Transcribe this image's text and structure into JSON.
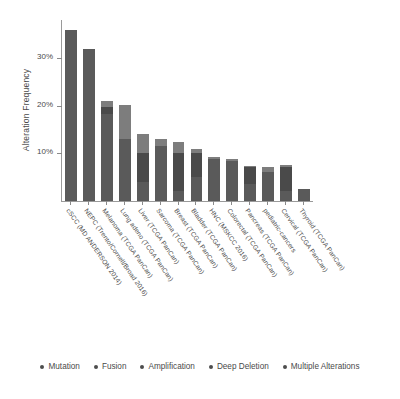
{
  "chart_data": {
    "type": "bar",
    "title": "",
    "subtitle": "",
    "xlabel": "",
    "ylabel": "Alteration Frequency",
    "stacked": true,
    "grid": false,
    "ylim": [
      0,
      38
    ],
    "yticks": [
      10,
      20,
      30
    ],
    "ytick_labels": [
      "10%",
      "20%",
      "30%"
    ],
    "legend_position": "bottom",
    "categories": [
      "cSCC (MD ANDERSON 2014)",
      "NEPC (Trento/Cornell/Broad 2016)",
      "Melanoma (TCGA PanCan)",
      "Lung adeno (TCGA PanCan)",
      "Liver (TCGA PanCan)",
      "Sarcoma (TCGA PanCan)",
      "Breast (TCGA PanCan)",
      "Bladder (TCGA PanCan)",
      "HNC (MSKCC 2016)",
      "Colorectal (TCGA PanCan)",
      "Pancreas (TCGA PanCan)",
      "pediatric-cancers",
      "Cervical (TCGA PanCan)",
      "Thyroid (TCGA PanCan)"
    ],
    "series": [
      {
        "name": "Mutation",
        "color": "#5a5a5a",
        "values": [
          36.0,
          32.0,
          18.3,
          13.0,
          4.0,
          11.6,
          2.2,
          5.0,
          8.8,
          8.4,
          3.6,
          6.0,
          2.0,
          2.6
        ]
      },
      {
        "name": "Fusion",
        "color": "#6e6e6e",
        "values": [
          0,
          0,
          0,
          0,
          0,
          0,
          0,
          0,
          0,
          0,
          0,
          0,
          0,
          0
        ]
      },
      {
        "name": "Amplification",
        "color": "#4a4a4a",
        "values": [
          0,
          0,
          1.4,
          0,
          6.0,
          0,
          7.8,
          5.0,
          0,
          0,
          3.6,
          0,
          5.2,
          0
        ]
      },
      {
        "name": "Deep Deletion",
        "color": "#7d7d7d",
        "values": [
          0,
          0,
          1.3,
          7.2,
          4.0,
          1.4,
          2.3,
          1.0,
          0.4,
          0.4,
          0.2,
          1.2,
          0.3,
          0
        ]
      },
      {
        "name": "Multiple Alterations",
        "color": "#636363",
        "values": [
          0,
          0,
          0,
          0,
          0,
          0,
          0,
          0,
          0,
          0,
          0,
          0,
          0,
          0
        ]
      }
    ],
    "totals": [
      36.0,
      32.0,
      21.0,
      20.2,
      14.0,
      13.0,
      12.3,
      11.0,
      9.2,
      8.8,
      7.4,
      7.2,
      7.5,
      2.6
    ]
  },
  "legend": {
    "items": [
      {
        "label": "Mutation",
        "color": "#4d4d4d"
      },
      {
        "label": "Fusion",
        "color": "#4d4d4d"
      },
      {
        "label": "Amplification",
        "color": "#4d4d4d"
      },
      {
        "label": "Deep Deletion",
        "color": "#4d4d4d"
      },
      {
        "label": "Multiple Alterations",
        "color": "#4d4d4d"
      }
    ]
  }
}
